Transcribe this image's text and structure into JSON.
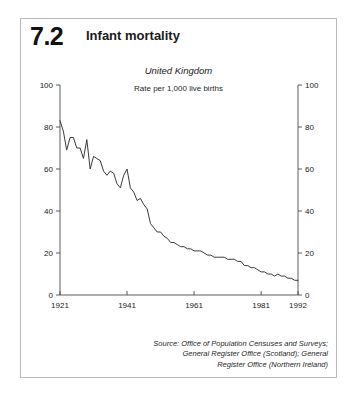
{
  "figure": {
    "number": "7.2",
    "title": "Infant mortality"
  },
  "source": {
    "line1": "Source: Office of Population Censuses and Surveys;",
    "line2": "General Register Office (Scotland); General",
    "line3": "Register Office (Northern Ireland)"
  },
  "colors": {
    "line": "#3a3a3a",
    "axis": "#4a4a4a",
    "text": "#1a1a1a",
    "panel_border": "#b9b9b9",
    "background": "#ffffff"
  },
  "chart_data": {
    "type": "line",
    "title": "Infant mortality",
    "subtitle": "United Kingdom",
    "annotation": "Rate per 1,000 live births",
    "xlabel": "",
    "ylabel": "",
    "xlim": [
      1921,
      1992
    ],
    "ylim": [
      0,
      100
    ],
    "grid": false,
    "legend": false,
    "x_ticks": [
      1921,
      1941,
      1961,
      1981,
      1992
    ],
    "x_tick_labels": [
      "1921",
      "1941",
      "1961",
      "1981",
      "1992"
    ],
    "y_ticks": [
      0,
      20,
      40,
      60,
      80,
      100
    ],
    "y_tick_labels": [
      "0",
      "20",
      "40",
      "60",
      "80",
      "100"
    ],
    "y_axis_right": true,
    "y_ticks_right": [
      0,
      20,
      40,
      60,
      80,
      100
    ],
    "y_tick_labels_right": [
      "0",
      "20",
      "40",
      "60",
      "80",
      "100"
    ],
    "series": [
      {
        "name": "Infant mortality rate",
        "x": [
          1921,
          1922,
          1923,
          1924,
          1925,
          1926,
          1927,
          1928,
          1929,
          1930,
          1931,
          1932,
          1933,
          1934,
          1935,
          1936,
          1937,
          1938,
          1939,
          1940,
          1941,
          1942,
          1943,
          1944,
          1945,
          1946,
          1947,
          1948,
          1949,
          1950,
          1951,
          1952,
          1953,
          1954,
          1955,
          1956,
          1957,
          1958,
          1959,
          1960,
          1961,
          1962,
          1963,
          1964,
          1965,
          1966,
          1967,
          1968,
          1969,
          1970,
          1971,
          1972,
          1973,
          1974,
          1975,
          1976,
          1977,
          1978,
          1979,
          1980,
          1981,
          1982,
          1983,
          1984,
          1985,
          1986,
          1987,
          1988,
          1989,
          1990,
          1991,
          1992
        ],
        "values": [
          83,
          78,
          69,
          75,
          75,
          70,
          70,
          65,
          74,
          60,
          66,
          65,
          64,
          59,
          57,
          59,
          58,
          53,
          51,
          57,
          60,
          51,
          49,
          45,
          46,
          43,
          41,
          34,
          32,
          30,
          30,
          28,
          27,
          25,
          25,
          24,
          23,
          23,
          22,
          22,
          21,
          21,
          21,
          20,
          19,
          19,
          18,
          18,
          18,
          18,
          17,
          17,
          17,
          16,
          16,
          14,
          14,
          13,
          13,
          12,
          11,
          11,
          10,
          10,
          9,
          10,
          9,
          9,
          8,
          8,
          7,
          7
        ]
      }
    ]
  }
}
